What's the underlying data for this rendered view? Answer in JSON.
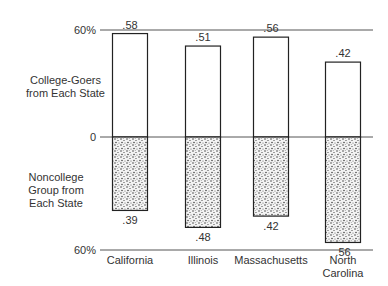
{
  "chart_data": {
    "type": "bar",
    "title": "",
    "categories": [
      "California",
      "Illinois",
      "Massachusetts",
      "North Carolina"
    ],
    "category_labels": [
      [
        "California"
      ],
      [
        "Illinois"
      ],
      [
        "Massachusetts"
      ],
      [
        "North",
        "Carolina"
      ]
    ],
    "series": [
      {
        "name": "College-Goers from Each State",
        "direction": "up",
        "values": [
          0.58,
          0.51,
          0.56,
          0.42
        ],
        "labels": [
          ".58",
          ".51",
          ".56",
          ".42"
        ],
        "fill": "#ffffff"
      },
      {
        "name": "Noncollege Group from Each State",
        "direction": "down",
        "values": [
          0.39,
          0.48,
          0.42,
          0.56
        ],
        "labels": [
          ".39",
          ".48",
          ".42",
          ".56"
        ],
        "fill": "stipple"
      }
    ],
    "axis": {
      "top_label": "60%",
      "zero_label": "0",
      "bottom_label": "60%"
    },
    "ylim": [
      -0.6,
      0.6
    ],
    "grid": false,
    "legend": "left side labels"
  },
  "side_labels": {
    "upper": [
      "College-Goers",
      "from Each State"
    ],
    "lower": [
      "Noncollege",
      "Group from",
      "Each State"
    ]
  }
}
